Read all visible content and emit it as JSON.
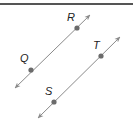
{
  "diagram": {
    "colors": {
      "line": "#8a8a8a",
      "point": "#6b6b6b",
      "label": "#222222",
      "rule": "#555555"
    },
    "lines": [
      {
        "name": "QR",
        "x1": 15,
        "y1": 88,
        "x2": 90,
        "y2": 15
      },
      {
        "name": "ST",
        "x1": 38,
        "y1": 118,
        "x2": 120,
        "y2": 37
      }
    ],
    "points": [
      {
        "label": "R",
        "x": 77,
        "y": 28,
        "lx": 67,
        "ly": 21
      },
      {
        "label": "Q",
        "x": 31,
        "y": 70,
        "lx": 20,
        "ly": 62
      },
      {
        "label": "T",
        "x": 101,
        "y": 56,
        "lx": 93,
        "ly": 49
      },
      {
        "label": "S",
        "x": 54,
        "y": 102,
        "lx": 45,
        "ly": 95
      }
    ]
  }
}
